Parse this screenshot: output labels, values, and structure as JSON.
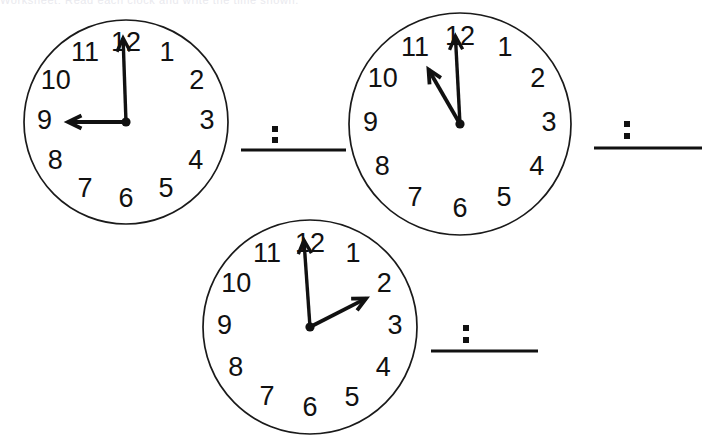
{
  "page": {
    "background_color": "#ffffff",
    "ink_color": "#111111",
    "width": 713,
    "height": 441,
    "cut_header_text": "Worksheet: Read each clock and write the time shown."
  },
  "clock_numerals": [
    "12",
    "1",
    "2",
    "3",
    "4",
    "5",
    "6",
    "7",
    "8",
    "9",
    "10",
    "11"
  ],
  "problems": [
    {
      "id": "problem-1",
      "clock": {
        "name": "clock-face-1",
        "cx": 126,
        "cy": 122,
        "r": 102,
        "numeral_radius": 80,
        "hour_value": 9,
        "minute_value": 0,
        "hour_hand_angle_deg": 270,
        "hour_hand_length": 58,
        "minute_hand_angle_deg": 358,
        "minute_hand_length": 84,
        "time_shown": "9:00"
      },
      "answer": {
        "name": "answer-blank-1",
        "line_x1": 241,
        "line_x2": 346,
        "line_y": 150,
        "colon_x": 275,
        "colon_y_top": 126,
        "colon_y_bottom": 137,
        "value": ""
      }
    },
    {
      "id": "problem-2",
      "clock": {
        "name": "clock-face-2",
        "cx": 460,
        "cy": 124,
        "r": 111,
        "numeral_radius": 88,
        "hour_value": 2,
        "minute_value": 0,
        "hour_hand_angle_deg": 330,
        "hour_hand_length": 63,
        "minute_hand_angle_deg": 357,
        "minute_hand_length": 88,
        "time_shown": "2:00"
      },
      "answer": {
        "name": "answer-blank-2",
        "line_x1": 594,
        "line_x2": 702,
        "line_y": 148,
        "colon_x": 627,
        "colon_y_top": 121,
        "colon_y_bottom": 133,
        "value": ""
      }
    },
    {
      "id": "problem-3",
      "clock": {
        "name": "clock-face-3",
        "cx": 310,
        "cy": 327,
        "r": 107,
        "numeral_radius": 84,
        "hour_value": 5,
        "minute_value": 0,
        "hour_hand_angle_deg": 63,
        "hour_hand_length": 63,
        "minute_hand_angle_deg": 356,
        "minute_hand_length": 87,
        "time_shown": "5:00"
      },
      "answer": {
        "name": "answer-blank-3",
        "line_x1": 431,
        "line_x2": 538,
        "line_y": 351,
        "colon_x": 466,
        "colon_y_top": 325,
        "colon_y_bottom": 337,
        "value": ""
      }
    }
  ]
}
